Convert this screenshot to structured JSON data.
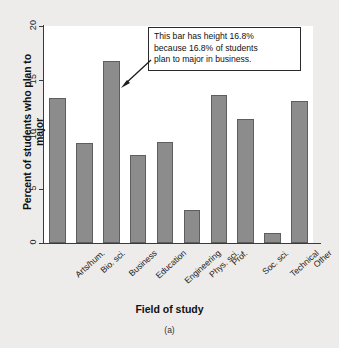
{
  "figure": {
    "panel_caption": "(a)",
    "background_color": "#eeecea",
    "plot_background_color": "#ffffff",
    "bar_fill_color": "#8c8c8c",
    "bar_edge_color": "#5e5e5e",
    "axis_color": "#3a3a3a"
  },
  "callout": {
    "text": "This bar has height 16.8% because 16.8% of students plan to major in business.",
    "line1": "This bar has height 16.8%",
    "line2": "because 16.8% of students",
    "line3": "plan to major in business.",
    "points_to": "Business",
    "arrow_icon": "arrow-pointer-icon"
  },
  "chart_data": {
    "type": "bar",
    "title": "",
    "xlabel": "Field of study",
    "ylabel": "Percent of students who plan to major",
    "categories": [
      "Arts/hum.",
      "Bio. sci.",
      "Business",
      "Education",
      "Engineering",
      "Phys. sci.",
      "Prof.",
      "Soc. sci.",
      "Technical",
      "Other"
    ],
    "values": [
      13.4,
      9.2,
      16.8,
      8.1,
      9.3,
      3.0,
      13.6,
      11.4,
      0.9,
      13.1
    ],
    "ylim": [
      0,
      20
    ],
    "yticks": [
      0,
      5,
      10,
      15,
      20
    ],
    "ytick_labels": [
      "0",
      "5",
      "10",
      "15",
      "20"
    ],
    "grid": false,
    "legend": "none"
  }
}
